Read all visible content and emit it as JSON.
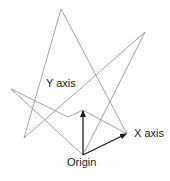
{
  "diagram": {
    "labels": {
      "y_axis": "Y axis",
      "x_axis": "X axis",
      "origin": "Origin"
    },
    "colors": {
      "background": "#ffffff",
      "thin_line": "#8a8a8a",
      "arrow": "#1a1a1a",
      "text": "#222222"
    },
    "points": {
      "origin": [
        83,
        155
      ],
      "y_tip": [
        83,
        110
      ],
      "x_tip": [
        127,
        134
      ],
      "top_peak": [
        61,
        9
      ],
      "right_peak": [
        145,
        32
      ],
      "left_point": [
        11,
        89
      ],
      "bottom_left": [
        24,
        138
      ],
      "mid_junction": [
        68,
        117
      ]
    }
  }
}
